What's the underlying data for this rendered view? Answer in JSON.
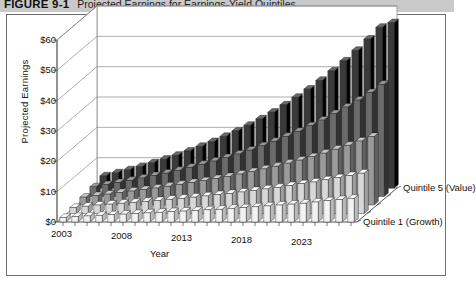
{
  "figure": {
    "tag": "FIGURE 9-1",
    "caption": "Projected Earnings for Earnings-Yield Quintiles"
  },
  "chart_data": {
    "type": "bar",
    "subtype": "3d-grouped-bar",
    "title": "Projected Earnings for Earnings-Yield Quintiles",
    "xlabel": "Year",
    "ylabel": "Projected Earnings",
    "zlabel": "Quintile",
    "ylim": [
      0,
      60
    ],
    "ytick_labels": [
      "$0",
      "$10",
      "$20",
      "$30",
      "$40",
      "$50",
      "$60"
    ],
    "ytick_values": [
      0,
      10,
      20,
      30,
      40,
      50,
      60
    ],
    "grid": true,
    "legend_position": "z-axis-right",
    "z_labels": [
      "Quintile 1 (Growth)",
      "Quintile 5 (Value)"
    ],
    "x": [
      2003,
      2004,
      2005,
      2006,
      2007,
      2008,
      2009,
      2010,
      2011,
      2012,
      2013,
      2014,
      2015,
      2016,
      2017,
      2018,
      2019,
      2020,
      2021,
      2022,
      2023,
      2024,
      2025,
      2026,
      2027
    ],
    "xtick_labels": [
      "2003",
      "2008",
      "2013",
      "2018",
      "2023"
    ],
    "xtick_values": [
      2003,
      2008,
      2013,
      2018,
      2023
    ],
    "series": [
      {
        "name": "Quintile 1 (Growth)",
        "color": "#f2f2f2",
        "values": [
          1.5,
          1.8,
          2.0,
          2.2,
          2.4,
          2.6,
          2.8,
          3.0,
          3.2,
          3.4,
          3.6,
          3.8,
          4.0,
          4.2,
          4.5,
          4.7,
          5.0,
          5.3,
          5.6,
          5.9,
          6.2,
          6.6,
          7.0,
          7.4,
          7.8
        ]
      },
      {
        "name": "Quintile 2",
        "color": "#d8d8d8",
        "values": [
          2.0,
          2.4,
          2.8,
          3.1,
          3.4,
          3.7,
          4.0,
          4.3,
          4.7,
          5.0,
          5.4,
          5.8,
          6.2,
          6.6,
          7.1,
          7.6,
          8.1,
          8.6,
          9.2,
          9.8,
          10.4,
          11.1,
          11.8,
          12.5,
          13.3
        ]
      },
      {
        "name": "Quintile 3",
        "color": "#9a9a9a",
        "values": [
          2.6,
          3.1,
          3.6,
          4.1,
          4.6,
          5.1,
          5.6,
          6.2,
          6.8,
          7.4,
          8.0,
          8.7,
          9.4,
          10.2,
          11.0,
          11.9,
          12.8,
          13.8,
          14.8,
          15.9,
          17.1,
          18.4,
          19.7,
          21.1,
          22.6
        ]
      },
      {
        "name": "Quintile 4",
        "color": "#6b6b6b",
        "values": [
          3.2,
          3.9,
          4.6,
          5.3,
          6.1,
          6.9,
          7.7,
          8.6,
          9.6,
          10.6,
          11.7,
          12.8,
          14.0,
          15.3,
          16.7,
          18.2,
          19.8,
          21.5,
          23.3,
          25.2,
          27.3,
          29.5,
          31.8,
          34.3,
          37.0
        ]
      },
      {
        "name": "Quintile 5 (Value)",
        "color": "#3a3a3a",
        "values": [
          4.0,
          5.0,
          6.0,
          7.1,
          8.3,
          9.5,
          10.8,
          12.2,
          13.7,
          15.3,
          17.0,
          18.8,
          20.7,
          22.8,
          25.0,
          27.4,
          29.9,
          32.6,
          35.5,
          38.6,
          41.9,
          45.4,
          49.1,
          53.0,
          54.5
        ]
      }
    ]
  }
}
